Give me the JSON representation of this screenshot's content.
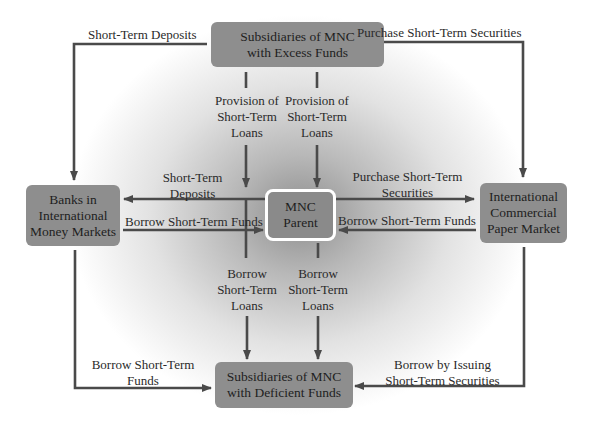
{
  "diagram": {
    "nodes": {
      "excess": {
        "label": "Subsidiaries of MNC\nwith Excess Funds"
      },
      "banks": {
        "label": "Banks in\nInternational\nMoney Markets"
      },
      "parent": {
        "label": "MNC\nParent"
      },
      "cp_market": {
        "label": "International\nCommercial\nPaper Market"
      },
      "deficient": {
        "label": "Subsidiaries of MNC\nwith Deficient Funds"
      }
    },
    "edges": {
      "excess_to_banks": "Short-Term Deposits",
      "excess_to_cp": "Purchase Short-Term Securities",
      "excess_to_parent_left": "Provision of\nShort-Term\nLoans",
      "excess_to_parent_right": "Provision of\nShort-Term\nLoans",
      "parent_to_banks": "Short-Term\nDeposits",
      "banks_to_parent": "Borrow Short-Term Funds",
      "parent_to_cp": "Purchase Short-Term\nSecurities",
      "cp_to_parent": "Borrow Short-Term Funds",
      "parent_to_deficient_left": "Borrow\nShort-Term\nLoans",
      "parent_to_deficient_right": "Borrow\nShort-Term\nLoans",
      "banks_to_deficient": "Borrow Short-Term\nFunds",
      "cp_to_deficient": "Borrow by Issuing\nShort-Term Securities"
    },
    "colors": {
      "box_fill": "#8e8e8e",
      "line": "#4a4a4a",
      "parent_border": "#ffffff"
    }
  }
}
